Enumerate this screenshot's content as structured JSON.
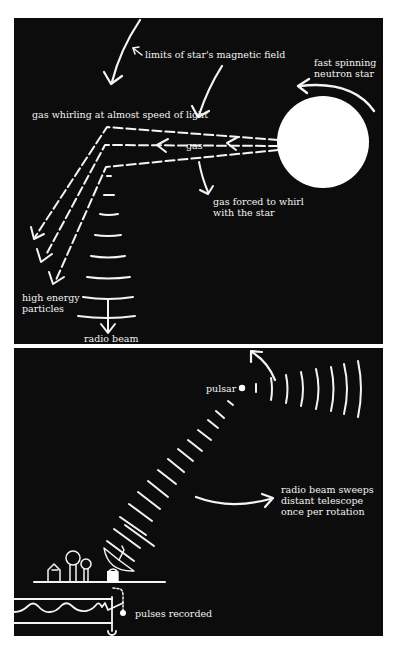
{
  "top_panel": {
    "labels": {
      "magnetic_field": "limits of star's magnetic field",
      "neutron_star_line1": "fast spinning",
      "neutron_star_line2": "neutron star",
      "gas_whirling": "gas whirling at almost speed of light",
      "gas": "gas",
      "gas_forced_line1": "gas forced to whirl",
      "gas_forced_line2": "with the star",
      "particles_line1": "high energy",
      "particles_line2": "particles",
      "radio_beam": "radio beam"
    }
  },
  "bottom_panel": {
    "labels": {
      "pulsar": "pulsar",
      "sweeps_line1": "radio beam sweeps",
      "sweeps_line2": "distant telescope",
      "sweeps_line3": "once per rotation",
      "pulses_recorded": "pulses recorded"
    }
  },
  "colors": {
    "background": "#0c0c0c",
    "ink": "#f4f4f4",
    "page": "#ffffff"
  }
}
